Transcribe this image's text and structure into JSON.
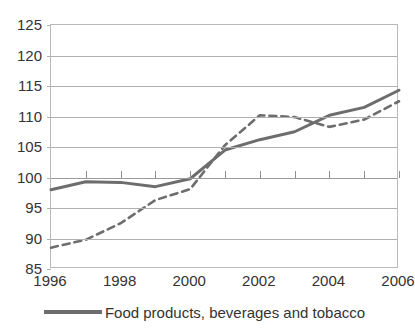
{
  "chart_data": {
    "type": "line",
    "title": "",
    "subtitle": "",
    "xlabel": "",
    "ylabel": "",
    "xlim": [
      1996,
      2006
    ],
    "ylim": [
      85,
      125
    ],
    "yticks": [
      85,
      90,
      95,
      100,
      105,
      110,
      115,
      120,
      125
    ],
    "xticks": [
      1996,
      1997,
      1998,
      1999,
      2000,
      2001,
      2002,
      2003,
      2004,
      2005,
      2006
    ],
    "xtick_labels": [
      "1996",
      "1998",
      "2000",
      "2002",
      "2004",
      "2006"
    ],
    "xtick_label_values": [
      1996,
      1998,
      2000,
      2002,
      2004,
      2006
    ],
    "grid": true,
    "grid_axis": "y",
    "legend_position": "bottom",
    "x": [
      1996,
      1997,
      1998,
      1999,
      2000,
      2001,
      2002,
      2003,
      2004,
      2005,
      2006
    ],
    "series": [
      {
        "name": "Food products, beverages and tobacco",
        "style": "solid",
        "color": "#6d6d6d",
        "in_legend": true,
        "values": [
          98.0,
          99.3,
          99.2,
          98.5,
          99.8,
          104.5,
          106.2,
          107.5,
          110.2,
          111.5,
          114.3
        ]
      },
      {
        "name": "",
        "style": "dashed",
        "color": "#6d6d6d",
        "in_legend": false,
        "values": [
          88.5,
          89.8,
          92.5,
          96.3,
          98.1,
          105.3,
          110.2,
          109.9,
          108.3,
          109.5,
          112.5
        ]
      }
    ]
  },
  "legend": {
    "entries": [
      {
        "label": "Food products, beverages and tobacco"
      }
    ]
  },
  "axes": {
    "y_labels": [
      "125",
      "120",
      "115",
      "110",
      "105",
      "100",
      "95",
      "90",
      "85"
    ],
    "x_labels": [
      "1996",
      "1998",
      "2000",
      "2002",
      "2004",
      "2006"
    ]
  }
}
